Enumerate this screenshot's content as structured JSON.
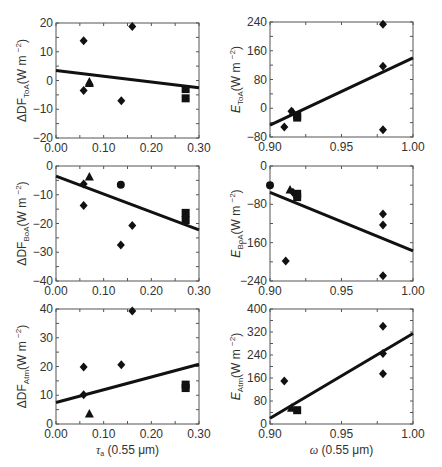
{
  "chart_data": [
    {
      "id": "dDF_ToA",
      "type": "scatter",
      "ylabel_main": "ΔDF",
      "ylabel_sub": "ToA",
      "ylabel_unit": "(W m",
      "ylabel_exp": "−2",
      "ylabel_close": ")",
      "ylabel_italic": false,
      "xlabel_main": "",
      "xlabel_rest": "",
      "xlim": [
        0.0,
        0.3
      ],
      "ylim": [
        -20,
        20
      ],
      "xticks": [
        0.0,
        0.1,
        0.2,
        0.3
      ],
      "xtick_labels": [
        "0.00",
        "0.10",
        "0.20",
        "0.30"
      ],
      "yticks": [
        -20,
        -10,
        0,
        10,
        20
      ],
      "ytick_labels": [
        "−20",
        "−10",
        "0",
        "10",
        "20"
      ],
      "fit": [
        [
          0.0,
          3.5
        ],
        [
          0.3,
          -2.5
        ]
      ],
      "points": [
        {
          "x": 0.058,
          "y": 13.8,
          "m": "diamond"
        },
        {
          "x": 0.058,
          "y": -3.5,
          "m": "diamond"
        },
        {
          "x": 0.07,
          "y": -0.5,
          "m": "triangle"
        },
        {
          "x": 0.07,
          "y": -1.0,
          "m": "triangle"
        },
        {
          "x": 0.137,
          "y": -7.0,
          "m": "diamond"
        },
        {
          "x": 0.16,
          "y": 18.8,
          "m": "diamond"
        },
        {
          "x": 0.272,
          "y": -3.0,
          "m": "square"
        },
        {
          "x": 0.272,
          "y": -6.2,
          "m": "square"
        }
      ]
    },
    {
      "id": "E_ToA",
      "type": "scatter",
      "ylabel_main": "E",
      "ylabel_sub": "ToA",
      "ylabel_unit": "(W m",
      "ylabel_exp": "−2",
      "ylabel_close": ")",
      "ylabel_italic": true,
      "xlabel_main": "",
      "xlabel_rest": "",
      "xlim": [
        0.9,
        1.0
      ],
      "ylim": [
        -80,
        240
      ],
      "xticks": [
        0.9,
        0.95,
        1.0
      ],
      "xtick_labels": [
        "0.90",
        "0.95",
        "1.00"
      ],
      "yticks": [
        -80,
        0,
        80,
        160,
        240
      ],
      "ytick_labels": [
        "−80",
        "0",
        "80",
        "160",
        "240"
      ],
      "fit": [
        [
          0.9,
          -47
        ],
        [
          1.0,
          140
        ]
      ],
      "points": [
        {
          "x": 0.91,
          "y": -52,
          "m": "diamond"
        },
        {
          "x": 0.915,
          "y": -8,
          "m": "diamond"
        },
        {
          "x": 0.916,
          "y": -12,
          "m": "triangle"
        },
        {
          "x": 0.919,
          "y": -20,
          "m": "square"
        },
        {
          "x": 0.919,
          "y": -26,
          "m": "square"
        },
        {
          "x": 0.979,
          "y": 234,
          "m": "diamond"
        },
        {
          "x": 0.979,
          "y": 117,
          "m": "diamond"
        },
        {
          "x": 0.979,
          "y": -60,
          "m": "diamond"
        }
      ]
    },
    {
      "id": "dDF_BoA",
      "type": "scatter",
      "ylabel_main": "ΔDF",
      "ylabel_sub": "BoA",
      "ylabel_unit": "(W m",
      "ylabel_exp": "−2",
      "ylabel_close": ")",
      "ylabel_italic": false,
      "xlabel_main": "",
      "xlabel_rest": "",
      "xlim": [
        0.0,
        0.3
      ],
      "ylim": [
        -40,
        0
      ],
      "xticks": [
        0.0,
        0.1,
        0.2,
        0.3
      ],
      "xtick_labels": [
        "0.00",
        "0.10",
        "0.20",
        "0.30"
      ],
      "yticks": [
        -40,
        -30,
        -20,
        -10,
        0
      ],
      "ytick_labels": [
        "−40",
        "−30",
        "−20",
        "−10",
        "0"
      ],
      "fit": [
        [
          0.0,
          -3.5
        ],
        [
          0.3,
          -22.2
        ]
      ],
      "points": [
        {
          "x": 0.058,
          "y": -6.3,
          "m": "diamond"
        },
        {
          "x": 0.058,
          "y": -13.7,
          "m": "diamond"
        },
        {
          "x": 0.07,
          "y": -3.8,
          "m": "triangle"
        },
        {
          "x": 0.136,
          "y": -6.5,
          "m": "circle"
        },
        {
          "x": 0.136,
          "y": -27.5,
          "m": "diamond"
        },
        {
          "x": 0.16,
          "y": -20.7,
          "m": "diamond"
        },
        {
          "x": 0.272,
          "y": -16.3,
          "m": "square"
        },
        {
          "x": 0.272,
          "y": -18.8,
          "m": "square"
        }
      ]
    },
    {
      "id": "E_BoA",
      "type": "scatter",
      "ylabel_main": "E",
      "ylabel_sub": "BoA",
      "ylabel_unit": "(W m",
      "ylabel_exp": "−2",
      "ylabel_close": ")",
      "ylabel_italic": true,
      "xlabel_main": "",
      "xlabel_rest": "",
      "xlim": [
        0.9,
        1.0
      ],
      "ylim": [
        -240,
        0
      ],
      "xticks": [
        0.9,
        0.95,
        1.0
      ],
      "xtick_labels": [
        "0.90",
        "0.95",
        "1.00"
      ],
      "yticks": [
        -240,
        -160,
        -80,
        0
      ],
      "ytick_labels": [
        "−240",
        "−160",
        "−80",
        "0"
      ],
      "fit": [
        [
          0.9,
          -55
        ],
        [
          1.0,
          -177
        ]
      ],
      "points": [
        {
          "x": 0.9,
          "y": -40,
          "m": "circle"
        },
        {
          "x": 0.914,
          "y": -50,
          "m": "triangle"
        },
        {
          "x": 0.916,
          "y": -55,
          "m": "diamond"
        },
        {
          "x": 0.919,
          "y": -58,
          "m": "square"
        },
        {
          "x": 0.919,
          "y": -65,
          "m": "square"
        },
        {
          "x": 0.911,
          "y": -198,
          "m": "diamond"
        },
        {
          "x": 0.979,
          "y": -100,
          "m": "diamond"
        },
        {
          "x": 0.979,
          "y": -123,
          "m": "diamond"
        },
        {
          "x": 0.979,
          "y": -229,
          "m": "diamond"
        }
      ]
    },
    {
      "id": "dDF_Atm",
      "type": "scatter",
      "ylabel_main": "ΔDF",
      "ylabel_sub": "Atm",
      "ylabel_unit": "(W m",
      "ylabel_exp": "−2",
      "ylabel_close": ")",
      "ylabel_italic": false,
      "xlabel_main": "τ",
      "xlabel_sub": "a",
      "xlabel_rest": " (0.55 μm)",
      "xlim": [
        0.0,
        0.3
      ],
      "ylim": [
        0,
        40
      ],
      "xticks": [
        0.0,
        0.1,
        0.2,
        0.3
      ],
      "xtick_labels": [
        "0.00",
        "0.10",
        "0.20",
        "0.30"
      ],
      "yticks": [
        0,
        10,
        20,
        30,
        40
      ],
      "ytick_labels": [
        "0",
        "10",
        "20",
        "30",
        "40"
      ],
      "fit": [
        [
          0.0,
          7.5
        ],
        [
          0.3,
          20.8
        ]
      ],
      "points": [
        {
          "x": 0.058,
          "y": 19.8,
          "m": "diamond"
        },
        {
          "x": 0.058,
          "y": 10.2,
          "m": "diamond"
        },
        {
          "x": 0.07,
          "y": 3.5,
          "m": "triangle"
        },
        {
          "x": 0.137,
          "y": 20.6,
          "m": "diamond"
        },
        {
          "x": 0.16,
          "y": 39.3,
          "m": "diamond"
        },
        {
          "x": 0.272,
          "y": 13.7,
          "m": "square"
        },
        {
          "x": 0.272,
          "y": 12.5,
          "m": "square"
        }
      ]
    },
    {
      "id": "E_Atm",
      "type": "scatter",
      "ylabel_main": "E",
      "ylabel_sub": "Atm",
      "ylabel_unit": "(W m",
      "ylabel_exp": "−2",
      "ylabel_close": ")",
      "ylabel_italic": true,
      "xlabel_main": "ω",
      "xlabel_sub": "",
      "xlabel_rest": " (0.55 μm)",
      "xlim": [
        0.9,
        1.0
      ],
      "ylim": [
        0,
        400
      ],
      "xticks": [
        0.9,
        0.95,
        1.0
      ],
      "xtick_labels": [
        "0.90",
        "0.95",
        "1.00"
      ],
      "yticks": [
        0,
        80,
        160,
        240,
        320,
        400
      ],
      "ytick_labels": [
        "0",
        "80",
        "160",
        "240",
        "320",
        "400"
      ],
      "fit": [
        [
          0.9,
          20
        ],
        [
          1.0,
          315
        ]
      ],
      "points": [
        {
          "x": 0.91,
          "y": 150,
          "m": "diamond"
        },
        {
          "x": 0.915,
          "y": 55,
          "m": "triangle"
        },
        {
          "x": 0.919,
          "y": 48,
          "m": "square"
        },
        {
          "x": 0.979,
          "y": 340,
          "m": "diamond"
        },
        {
          "x": 0.979,
          "y": 245,
          "m": "diamond"
        },
        {
          "x": 0.979,
          "y": 175,
          "m": "diamond"
        }
      ]
    }
  ]
}
